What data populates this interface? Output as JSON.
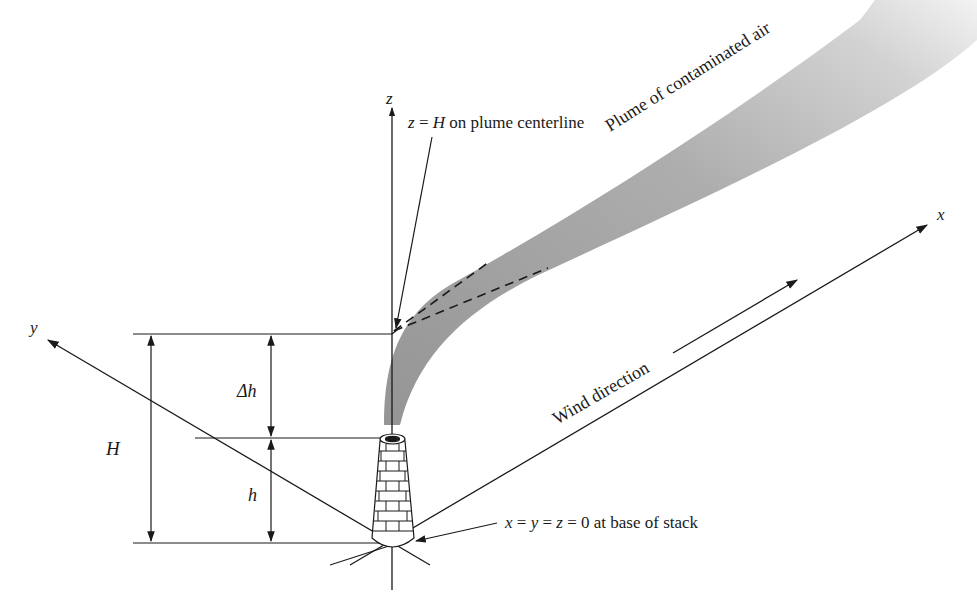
{
  "diagram": {
    "axes": {
      "x_label": "x",
      "y_label": "y",
      "z_label": "z"
    },
    "annotations": {
      "plume_centerline": "z = H on plume centerline",
      "plume_centerline_var": "z",
      "plume_centerline_eq": " = ",
      "plume_centerline_H": "H",
      "plume_centerline_rest": " on plume centerline",
      "plume_label": "Plume of contaminated air",
      "wind_label": "Wind direction",
      "origin_label": "x = y = z = 0 at base of stack",
      "origin_x": "x",
      "origin_y": "y",
      "origin_z": "z",
      "origin_eq": " = ",
      "origin_rest": " = 0 at base of stack"
    },
    "dimensions": {
      "total_height": "H",
      "plume_rise": "Δh",
      "stack_height": "h"
    },
    "colors": {
      "line": "#1a1a1a",
      "plume": "#9e9e9e",
      "background": "#ffffff"
    }
  }
}
